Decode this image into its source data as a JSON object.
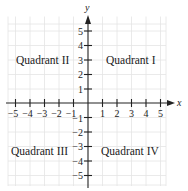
{
  "diagram": {
    "type": "coordinate-plane",
    "axes": {
      "x_label": "x",
      "y_label": "y",
      "x_range": [
        -5,
        5
      ],
      "y_range": [
        -5,
        5
      ]
    },
    "x_ticks": [
      "−5",
      "−4",
      "−3",
      "−2",
      "−1",
      "1",
      "2",
      "3",
      "4",
      "5"
    ],
    "y_ticks": [
      "5",
      "4",
      "3",
      "2",
      "1",
      "−1",
      "−2",
      "−3",
      "−4",
      "−5"
    ],
    "quadrants": {
      "q1": "Quadrant I",
      "q2": "Quadrant II",
      "q3": "Quadrant III",
      "q4": "Quadrant IV"
    },
    "colors": {
      "axis": "#222222",
      "grid": "#e2e2e2",
      "text": "#222222"
    }
  }
}
